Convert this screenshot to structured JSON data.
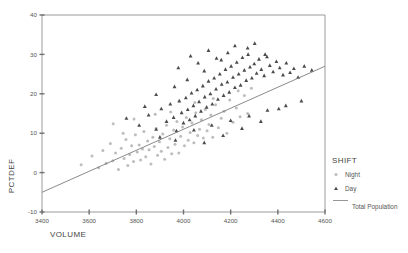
{
  "chart_data": {
    "type": "scatter",
    "title": "",
    "xlabel": "VOLUME",
    "ylabel": "PCTDEF",
    "xlim": [
      3400,
      4600
    ],
    "ylim": [
      -10,
      40
    ],
    "xticks": [
      3400,
      3600,
      3800,
      4000,
      4200,
      4400,
      4600
    ],
    "xticklabels": [
      "3400",
      "3600",
      "3800",
      "4000",
      "4200",
      "4400",
      "4600"
    ],
    "yticks": [
      -10,
      0,
      10,
      20,
      30,
      40
    ],
    "yticklabels": [
      "-10",
      "0",
      "10",
      "20",
      "30",
      "40"
    ],
    "grid": false,
    "legend_position": "right",
    "legend": {
      "title": "SHIFT",
      "entries": [
        {
          "label": "Night",
          "marker": "circle",
          "color": "#bdbdbd"
        },
        {
          "label": "Day",
          "marker": "triangle",
          "color": "#4c4c4c"
        }
      ],
      "line_entry": {
        "label": "Total Population",
        "color": "#8a8a8a"
      }
    },
    "fit_line": {
      "name": "Total Population",
      "x": [
        3400,
        4600
      ],
      "y": [
        -5.0,
        27.0
      ],
      "slope": 0.0267,
      "intercept": -95.7
    },
    "series": [
      {
        "name": "Night",
        "marker": "circle",
        "color": "#bdbdbd",
        "points": [
          [
            3566,
            2.0
          ],
          [
            3612,
            4.2
          ],
          [
            3640,
            1.2
          ],
          [
            3658,
            5.6
          ],
          [
            3672,
            2.4
          ],
          [
            3690,
            7.4
          ],
          [
            3700,
            3.0
          ],
          [
            3712,
            5.0
          ],
          [
            3724,
            0.8
          ],
          [
            3736,
            6.2
          ],
          [
            3748,
            3.6
          ],
          [
            3756,
            8.4
          ],
          [
            3764,
            1.8
          ],
          [
            3772,
            4.6
          ],
          [
            3780,
            6.8
          ],
          [
            3788,
            2.8
          ],
          [
            3796,
            9.6
          ],
          [
            3804,
            5.2
          ],
          [
            3812,
            7.0
          ],
          [
            3818,
            3.2
          ],
          [
            3826,
            6.0
          ],
          [
            3832,
            10.4
          ],
          [
            3840,
            4.0
          ],
          [
            3848,
            8.0
          ],
          [
            3854,
            5.8
          ],
          [
            3862,
            2.2
          ],
          [
            3870,
            9.0
          ],
          [
            3876,
            6.6
          ],
          [
            3884,
            11.2
          ],
          [
            3890,
            4.4
          ],
          [
            3898,
            7.8
          ],
          [
            3906,
            5.4
          ],
          [
            3912,
            9.8
          ],
          [
            3920,
            3.4
          ],
          [
            3928,
            12.0
          ],
          [
            3934,
            6.4
          ],
          [
            3942,
            8.6
          ],
          [
            3950,
            4.8
          ],
          [
            3958,
            10.8
          ],
          [
            3964,
            7.2
          ],
          [
            3972,
            13.0
          ],
          [
            3980,
            5.0
          ],
          [
            3988,
            9.2
          ],
          [
            3996,
            11.6
          ],
          [
            4004,
            6.8
          ],
          [
            4012,
            14.0
          ],
          [
            4020,
            8.2
          ],
          [
            4028,
            10.2
          ],
          [
            4036,
            12.6
          ],
          [
            4044,
            7.6
          ],
          [
            4052,
            15.2
          ],
          [
            4060,
            9.4
          ],
          [
            4068,
            11.0
          ],
          [
            4076,
            13.4
          ],
          [
            4084,
            8.8
          ],
          [
            4092,
            16.0
          ],
          [
            4100,
            10.6
          ],
          [
            4108,
            12.2
          ],
          [
            4116,
            14.6
          ],
          [
            4124,
            9.0
          ],
          [
            4136,
            17.2
          ],
          [
            4148,
            11.4
          ],
          [
            4160,
            13.8
          ],
          [
            4172,
            15.6
          ],
          [
            4184,
            10.0
          ],
          [
            4196,
            18.4
          ],
          [
            4210,
            12.8
          ],
          [
            4224,
            16.4
          ],
          [
            4240,
            14.2
          ],
          [
            4258,
            19.6
          ],
          [
            3702,
            12.4
          ],
          [
            3744,
            10.0
          ],
          [
            3790,
            13.6
          ],
          [
            3880,
            14.8
          ],
          [
            3946,
            15.4
          ],
          [
            4048,
            17.8
          ],
          [
            4126,
            18.8
          ],
          [
            4232,
            20.8
          ],
          [
            4272,
            15.0
          ],
          [
            4288,
            21.4
          ]
        ]
      },
      {
        "name": "Day",
        "marker": "triangle",
        "color": "#4c4c4c",
        "points": [
          [
            3758,
            13.8
          ],
          [
            3812,
            12.0
          ],
          [
            3852,
            14.6
          ],
          [
            3884,
            11.0
          ],
          [
            3906,
            16.2
          ],
          [
            3928,
            13.0
          ],
          [
            3944,
            17.4
          ],
          [
            3958,
            14.0
          ],
          [
            3970,
            10.6
          ],
          [
            3982,
            18.2
          ],
          [
            3992,
            15.2
          ],
          [
            4000,
            12.6
          ],
          [
            4010,
            19.0
          ],
          [
            4018,
            16.0
          ],
          [
            4026,
            13.4
          ],
          [
            4034,
            20.2
          ],
          [
            4042,
            17.0
          ],
          [
            4050,
            14.4
          ],
          [
            4058,
            21.0
          ],
          [
            4066,
            18.0
          ],
          [
            4074,
            15.6
          ],
          [
            4082,
            22.0
          ],
          [
            4090,
            19.2
          ],
          [
            4098,
            16.6
          ],
          [
            4106,
            23.2
          ],
          [
            4114,
            20.0
          ],
          [
            4122,
            17.4
          ],
          [
            4130,
            24.0
          ],
          [
            4138,
            21.2
          ],
          [
            4146,
            18.6
          ],
          [
            4154,
            25.0
          ],
          [
            4162,
            22.4
          ],
          [
            4170,
            19.6
          ],
          [
            4178,
            26.2
          ],
          [
            4186,
            23.0
          ],
          [
            4194,
            20.4
          ],
          [
            4202,
            27.0
          ],
          [
            4210,
            24.2
          ],
          [
            4218,
            21.6
          ],
          [
            4226,
            28.0
          ],
          [
            4234,
            25.0
          ],
          [
            4242,
            22.2
          ],
          [
            4250,
            29.2
          ],
          [
            4258,
            26.0
          ],
          [
            4266,
            23.4
          ],
          [
            4274,
            30.0
          ],
          [
            4282,
            26.8
          ],
          [
            4290,
            24.0
          ],
          [
            4300,
            27.6
          ],
          [
            4310,
            25.2
          ],
          [
            4320,
            28.8
          ],
          [
            4330,
            26.2
          ],
          [
            4342,
            24.6
          ],
          [
            4354,
            29.4
          ],
          [
            4366,
            27.2
          ],
          [
            4380,
            25.6
          ],
          [
            4394,
            28.2
          ],
          [
            4408,
            26.6
          ],
          [
            4422,
            24.8
          ],
          [
            4436,
            27.8
          ],
          [
            4452,
            25.4
          ],
          [
            4468,
            26.4
          ],
          [
            4486,
            24.2
          ],
          [
            4512,
            27.0
          ],
          [
            4544,
            26.0
          ],
          [
            3884,
            19.8
          ],
          [
            3962,
            21.8
          ],
          [
            4016,
            23.6
          ],
          [
            4088,
            25.8
          ],
          [
            4160,
            28.6
          ],
          [
            4106,
            31.0
          ],
          [
            4188,
            30.4
          ],
          [
            4272,
            31.6
          ],
          [
            4346,
            30.0
          ],
          [
            4030,
            29.6
          ],
          [
            3978,
            26.6
          ],
          [
            4062,
            27.8
          ],
          [
            4140,
            29.0
          ],
          [
            4218,
            32.2
          ],
          [
            4302,
            32.8
          ],
          [
            3836,
            16.8
          ],
          [
            3900,
            9.0
          ],
          [
            3966,
            8.2
          ],
          [
            4044,
            10.8
          ],
          [
            4120,
            12.0
          ],
          [
            4200,
            13.2
          ],
          [
            4278,
            14.4
          ],
          [
            4356,
            15.8
          ],
          [
            4434,
            17.0
          ],
          [
            4500,
            18.2
          ],
          [
            4088,
            7.6
          ],
          [
            4168,
            9.4
          ],
          [
            4248,
            11.2
          ],
          [
            4328,
            13.0
          ],
          [
            4404,
            16.2
          ]
        ]
      }
    ]
  }
}
